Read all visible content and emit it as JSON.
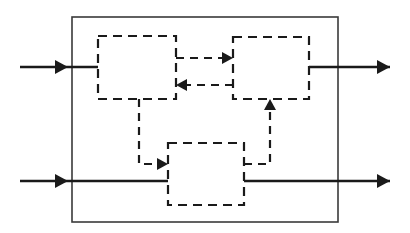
{
  "figure": {
    "type": "block-diagram",
    "title": "",
    "background_color": "#ffffff",
    "width": 410,
    "height": 233
  },
  "style": {
    "line_color": "#1a1a1a",
    "outer_boundary_color": "#3a3a3a",
    "dashed_block_color": "#1a1a1a",
    "outer_boundary_stroke_width": 1.6,
    "dashed_block_stroke_width": 2.2,
    "solid_signal_stroke_width": 2.6,
    "dashed_signal_stroke_width": 2.2,
    "block_dash_pattern": "9 6",
    "signal_dash_pattern": "8 6"
  },
  "outer_boundary": {
    "name": "system-boundary",
    "x": 72,
    "y": 17,
    "width": 266,
    "height": 205
  },
  "blocks": [
    {
      "id": "block-top-left",
      "label": "",
      "x": 98,
      "y": 36,
      "width": 78,
      "height": 63,
      "outline": "dashed"
    },
    {
      "id": "block-top-right",
      "label": "",
      "x": 233,
      "y": 37,
      "width": 76,
      "height": 62,
      "outline": "dashed"
    },
    {
      "id": "block-bottom-center",
      "label": "",
      "x": 168,
      "y": 143,
      "width": 76,
      "height": 62,
      "outline": "dashed"
    }
  ],
  "signals": {
    "external_inputs": [
      {
        "id": "input-top",
        "label": "",
        "style": "solid",
        "from_x": 20,
        "to_x": 98,
        "y": 67,
        "arrowhead_x": 68,
        "direction": "right"
      },
      {
        "id": "input-bottom",
        "label": "",
        "style": "solid",
        "from_x": 20,
        "to_x": 168,
        "y": 181,
        "arrowhead_x": 68,
        "direction": "right"
      }
    ],
    "external_outputs": [
      {
        "id": "output-top",
        "label": "",
        "style": "solid",
        "from_x": 309,
        "to_x": 390,
        "y": 67,
        "arrowhead_x": 390,
        "direction": "right"
      },
      {
        "id": "output-bottom",
        "label": "",
        "style": "solid",
        "from_x": 244,
        "to_x": 390,
        "y": 181,
        "arrowhead_x": 390,
        "direction": "right"
      }
    ],
    "internal_links": [
      {
        "id": "link-topleft-to-topright",
        "label": "",
        "style": "dashed",
        "from_block": "block-top-left",
        "to_block": "block-top-right",
        "from_x": 176,
        "to_x": 233,
        "y": 58,
        "direction": "right"
      },
      {
        "id": "link-topright-to-topleft",
        "label": "",
        "style": "dashed",
        "from_block": "block-top-right",
        "to_block": "block-top-left",
        "from_x": 233,
        "to_x": 176,
        "y": 85,
        "direction": "left"
      },
      {
        "id": "link-topleft-to-bottom",
        "label": "",
        "style": "dashed",
        "from_block": "block-top-left",
        "to_block": "block-bottom-center",
        "start_x": 139,
        "start_y": 99,
        "corner_y": 164,
        "end_x": 168,
        "direction": "right"
      },
      {
        "id": "link-bottom-to-topright",
        "label": "",
        "style": "dashed",
        "from_block": "block-bottom-center",
        "to_block": "block-top-right",
        "start_x": 244,
        "start_y": 164,
        "corner_x": 270,
        "end_y": 99,
        "direction": "up"
      }
    ]
  },
  "legend": {
    "solid_meaning": "",
    "dashed_meaning": ""
  }
}
